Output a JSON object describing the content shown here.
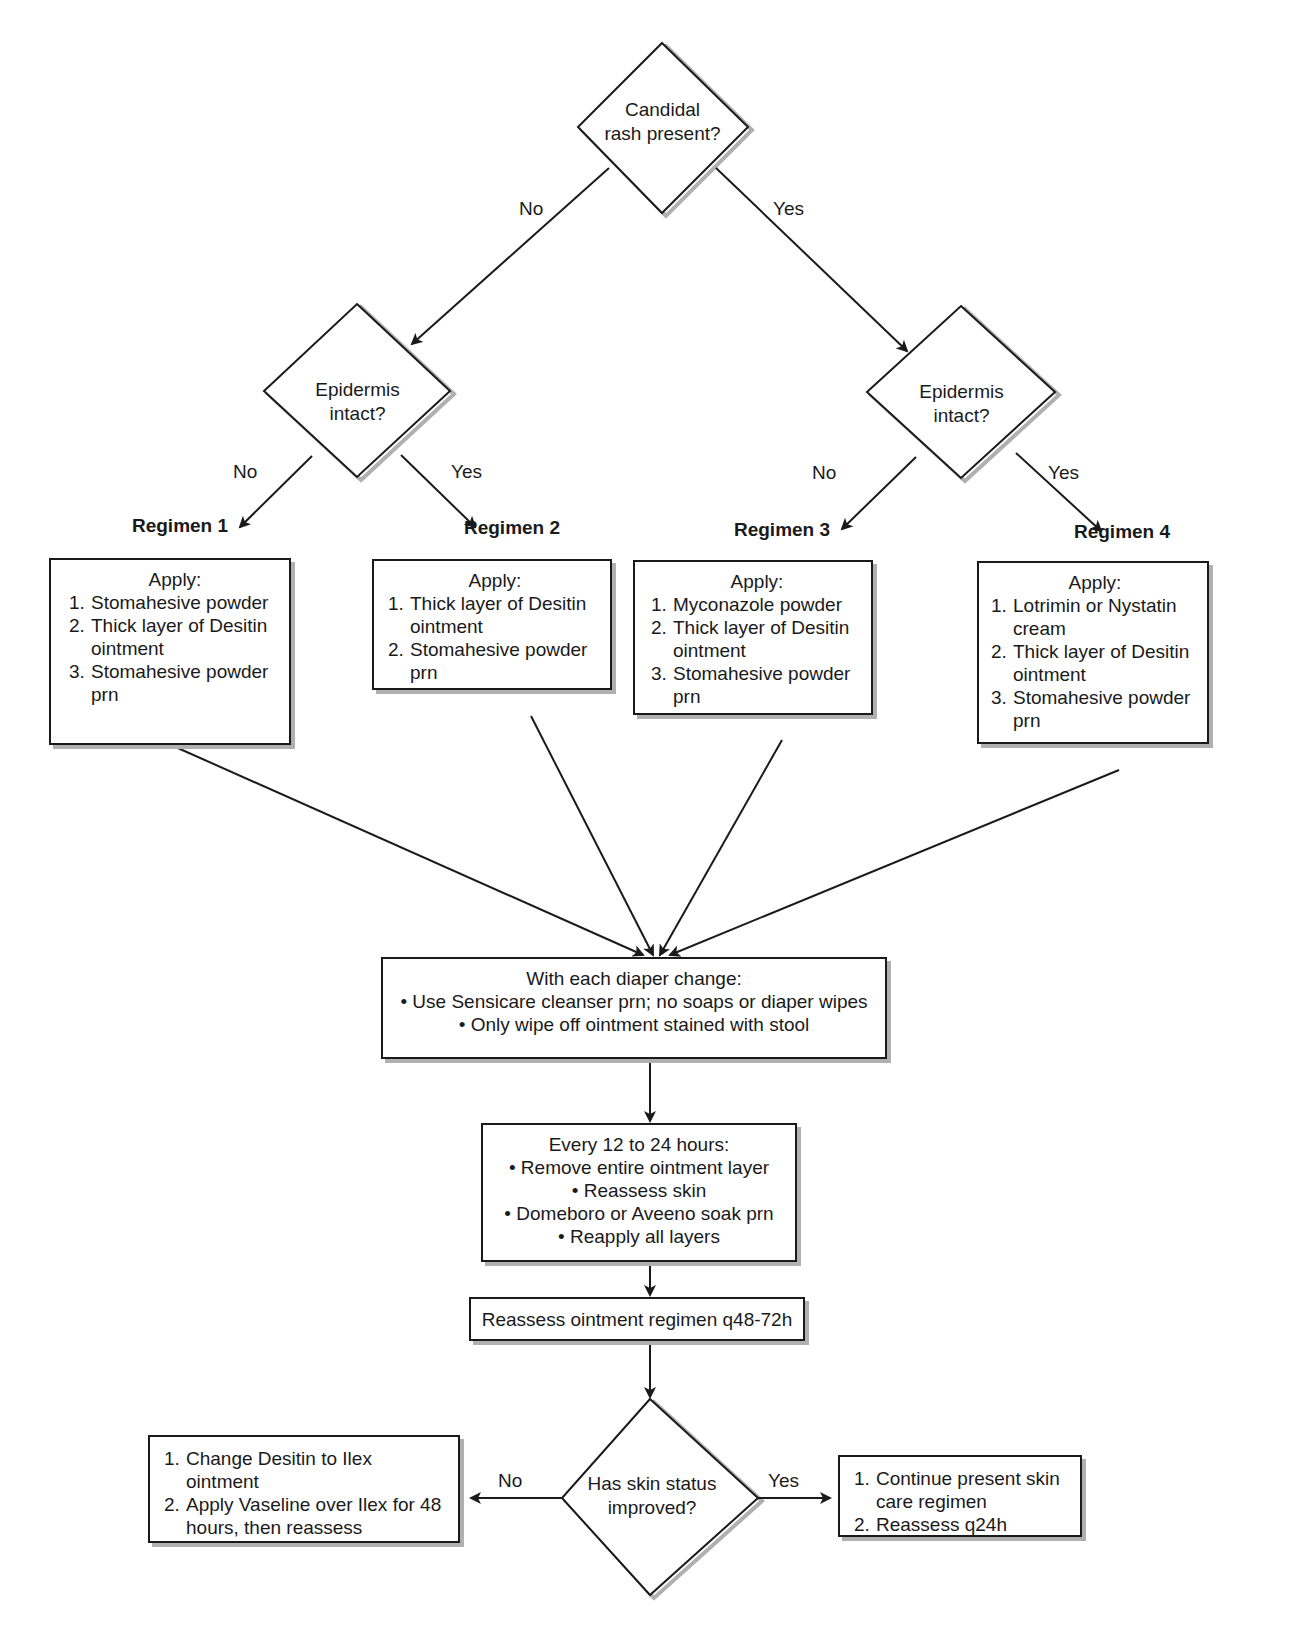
{
  "diagram": {
    "start_decision": {
      "text_line1": "Candidal",
      "text_line2": "rash present?"
    },
    "start_no_label": "No",
    "start_yes_label": "Yes",
    "left_decision": {
      "text_line1": "Epidermis",
      "text_line2": "intact?",
      "no_label": "No",
      "yes_label": "Yes"
    },
    "right_decision": {
      "text_line1": "Epidermis",
      "text_line2": "intact?",
      "no_label": "No",
      "yes_label": "Yes"
    },
    "regimens": [
      {
        "title": "Regimen 1",
        "heading": "Apply:",
        "items": [
          {
            "n": "1.",
            "text": "Stomahesive powder"
          },
          {
            "n": "2.",
            "text": "Thick layer of Desitin ointment"
          },
          {
            "n": "3.",
            "text": "Stomahesive powder prn"
          }
        ]
      },
      {
        "title": "Regimen 2",
        "heading": "Apply:",
        "items": [
          {
            "n": "1.",
            "text": "Thick layer of Desitin ointment"
          },
          {
            "n": "2.",
            "text": "Stomahesive powder prn"
          }
        ]
      },
      {
        "title": "Regimen 3",
        "heading": "Apply:",
        "items": [
          {
            "n": "1.",
            "text": "Myconazole powder"
          },
          {
            "n": "2.",
            "text": "Thick layer of Desitin ointment"
          },
          {
            "n": "3.",
            "text": "Stomahesive powder prn"
          }
        ]
      },
      {
        "title": "Regimen 4",
        "heading": "Apply:",
        "items": [
          {
            "n": "1.",
            "text": "Lotrimin or Nystatin cream"
          },
          {
            "n": "2.",
            "text": "Thick layer of Desitin ointment"
          },
          {
            "n": "3.",
            "text": "Stomahesive powder prn"
          }
        ]
      }
    ],
    "diaper_change": {
      "heading": "With each diaper change:",
      "bullets": [
        "• Use Sensicare cleanser prn; no soaps or diaper wipes",
        "• Only wipe off ointment stained with stool"
      ]
    },
    "every_12_24": {
      "heading": "Every 12 to 24 hours:",
      "bullets": [
        "• Remove entire ointment layer",
        "• Reassess skin",
        "• Domeboro or Aveeno soak prn",
        "• Reapply all layers"
      ]
    },
    "reassess_box": "Reassess ointment regimen q48-72h",
    "final_decision": {
      "text_line1": "Has skin status",
      "text_line2": "improved?",
      "no_label": "No",
      "yes_label": "Yes"
    },
    "no_outcome": {
      "items": [
        {
          "n": "1.",
          "text": "Change Desitin to Ilex ointment"
        },
        {
          "n": "2.",
          "text": "Apply Vaseline over Ilex for 48 hours, then reassess"
        }
      ]
    },
    "yes_outcome": {
      "items": [
        {
          "n": "1.",
          "text": "Continue present skin care regimen"
        },
        {
          "n": "2.",
          "text": "Reassess q24h"
        }
      ]
    }
  }
}
